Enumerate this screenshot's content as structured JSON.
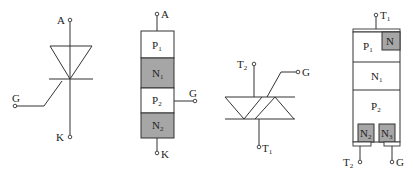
{
  "figures": [
    {
      "id": "scr-symbol",
      "terminals": {
        "anode": "A",
        "gate": "G",
        "cathode": "K"
      }
    },
    {
      "id": "scr-structure",
      "layers": [
        {
          "label": "P",
          "sub": "1",
          "fill": "#ffffff"
        },
        {
          "label": "N",
          "sub": "1",
          "fill": "#a6a6a6"
        },
        {
          "label": "P",
          "sub": "2",
          "fill": "#ffffff"
        },
        {
          "label": "N",
          "sub": "2",
          "fill": "#a6a6a6"
        }
      ],
      "terminals": {
        "anode": "A",
        "gate": "G",
        "cathode": "K"
      }
    },
    {
      "id": "triac-symbol",
      "terminals": {
        "t2": "T",
        "t2_sub": "2",
        "t1": "T",
        "t1_sub": "1",
        "gate": "G"
      }
    },
    {
      "id": "triac-structure",
      "layers": [
        {
          "label": "P",
          "sub": "1"
        },
        {
          "label": "N",
          "sub": "1"
        },
        {
          "label": "P",
          "sub": "2"
        }
      ],
      "regions": [
        {
          "label": "N",
          "sub": "",
          "fill": "#a6a6a6"
        },
        {
          "label": "N",
          "sub": "2",
          "fill": "#a6a6a6"
        },
        {
          "label": "N",
          "sub": "3",
          "fill": "#a6a6a6"
        }
      ],
      "terminals": {
        "t1": "T",
        "t1_sub": "1",
        "t2": "T",
        "t2_sub": "2",
        "gate": "G"
      }
    }
  ]
}
